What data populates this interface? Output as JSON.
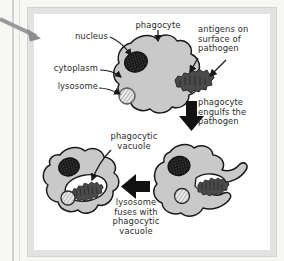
{
  "figure": {
    "frame_color": "#e2e2e0",
    "page_color": "#f6f6f4",
    "canvas_color": "#ffffff"
  },
  "palette": {
    "cytoplasm": "#c9c9c9",
    "cell_outline": "#1a1a1a",
    "nucleus": "#1a1a1a",
    "pathogen": "#4a4a4a",
    "lysosome_fill": "#e8e8e8",
    "vacuole_fill": "#ffffff",
    "arrow_black": "#121212",
    "leader_line": "#1a1a1a",
    "pointer_arrow": "#8a8a8a",
    "text": "#2b2b2b"
  },
  "labels": {
    "phagocyte": "phagocyte",
    "nucleus": "nucleus",
    "cytoplasm": "cytoplasm",
    "lysosome": "lysosome",
    "antigens": "antigens on\nsurface of\npathogen",
    "engulfs": "phagocyte\nengulfs the\npathogen",
    "vacuole": "phagocytic\nvacuole",
    "fuses": "lysosome\nfuses with\nphagocytic\nvacuole"
  },
  "steps": [
    {
      "id": "step-1",
      "name": "phagocyte-and-pathogen",
      "caption": "phagocyte",
      "structures": [
        "nucleus",
        "cytoplasm",
        "lysosome"
      ]
    },
    {
      "id": "step-2",
      "name": "engulfment",
      "caption": "phagocyte engulfs the pathogen",
      "structures": [
        "nucleus",
        "lysosome",
        "pathogen"
      ]
    },
    {
      "id": "step-3",
      "name": "lysosome-fusion",
      "caption": "lysosome fuses with phagocytic vacuole",
      "structures": [
        "nucleus",
        "lysosome",
        "phagocytic vacuole",
        "pathogen"
      ]
    }
  ],
  "icons": {
    "pointer_arrow": "arrow-right-gray",
    "flow_down": "arrow-down-black",
    "flow_left": "arrow-left-black"
  }
}
